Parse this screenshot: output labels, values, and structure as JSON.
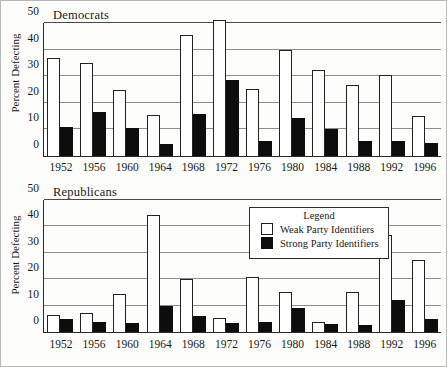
{
  "chart_data": [
    {
      "type": "bar",
      "title": "Democrats",
      "xlabel": "",
      "ylabel": "Percent Defecting",
      "ylim": [
        0,
        50
      ],
      "yticks": [
        0,
        10,
        20,
        30,
        40,
        50
      ],
      "grid": true,
      "categories": [
        "1952",
        "1956",
        "1960",
        "1964",
        "1968",
        "1972",
        "1976",
        "1980",
        "1984",
        "1988",
        "1992",
        "1996"
      ],
      "series": [
        {
          "name": "Weak Party Identifiers",
          "values": [
            37,
            35,
            24.8,
            15.6,
            45.5,
            51,
            25.2,
            40,
            32.5,
            26.8,
            30.4,
            15.2
          ]
        },
        {
          "name": "Strong Party Identifiers",
          "values": [
            11,
            16.4,
            10.6,
            4.6,
            15.7,
            28.5,
            5.5,
            14.2,
            10.2,
            5.6,
            5.6,
            5.0
          ]
        }
      ]
    },
    {
      "type": "bar",
      "title": "Republicans",
      "xlabel": "",
      "ylabel": "Percent Defecting",
      "ylim": [
        0,
        50
      ],
      "yticks": [
        0,
        10,
        20,
        30,
        40,
        50
      ],
      "grid": true,
      "categories": [
        "1952",
        "1956",
        "1960",
        "1964",
        "1968",
        "1972",
        "1976",
        "1980",
        "1984",
        "1988",
        "1992",
        "1996"
      ],
      "series": [
        {
          "name": "Weak Party Identifiers",
          "values": [
            6.4,
            7.1,
            14.5,
            44.5,
            19.9,
            5.2,
            21.0,
            15.1,
            3.9,
            15.0,
            36.8,
            27.3
          ]
        },
        {
          "name": "Strong Party Identifiers",
          "values": [
            4.8,
            3.8,
            3.3,
            10.0,
            5.9,
            3.5,
            3.7,
            9.2,
            2.9,
            2.6,
            12.0,
            4.8
          ]
        }
      ]
    }
  ],
  "democrats": {
    "title": "Democrats",
    "ylabel": "Percent Defecting",
    "yticks": [
      "50",
      "40",
      "30",
      "20",
      "10",
      "0"
    ],
    "xticks": [
      "1952",
      "1956",
      "1960",
      "1964",
      "1968",
      "1972",
      "1976",
      "1980",
      "1984",
      "1988",
      "1992",
      "1996"
    ]
  },
  "republicans": {
    "title": "Republicans",
    "ylabel": "Percent Defecting",
    "yticks": [
      "50",
      "40",
      "30",
      "20",
      "10",
      "0"
    ],
    "xticks": [
      "1952",
      "1956",
      "1960",
      "1964",
      "1968",
      "1972",
      "1976",
      "1980",
      "1984",
      "1988",
      "1992",
      "1996"
    ]
  },
  "legend": {
    "title": "Legend",
    "weak_label": "Weak Party Identifiers",
    "strong_label": "Strong Party Identifiers",
    "weak_color": "#ffffff",
    "strong_color": "#0d0d0d"
  }
}
